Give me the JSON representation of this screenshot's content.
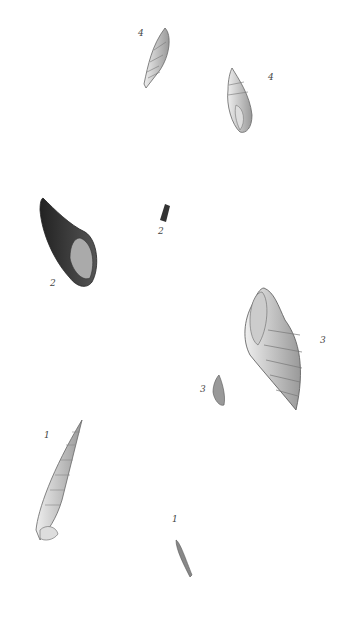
{
  "plate": {
    "figures": [
      {
        "id": "fig4a",
        "label": "4",
        "description": "fusiform shell with axial ribs, enlarged"
      },
      {
        "id": "fig4b",
        "label": "4",
        "description": "fusiform shell, aperture view"
      },
      {
        "id": "fig2a",
        "label": "2",
        "description": "dark whelk-like shell, enlarged, aperture view"
      },
      {
        "id": "fig2b",
        "label": "2",
        "description": "dark shell, natural size"
      },
      {
        "id": "fig3a",
        "label": "3",
        "description": "cancellate shell with spiral ridges, enlarged"
      },
      {
        "id": "fig3b",
        "label": "3",
        "description": "small shell, natural size"
      },
      {
        "id": "fig1a",
        "label": "1",
        "description": "long turreted shell, enlarged"
      },
      {
        "id": "fig1b",
        "label": "1",
        "description": "small turreted shell, natural size"
      }
    ]
  }
}
